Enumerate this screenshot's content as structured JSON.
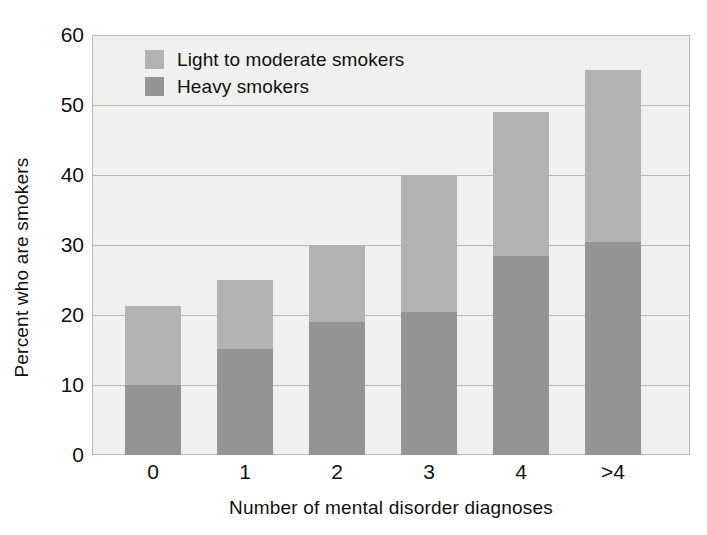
{
  "chart_data": {
    "type": "bar",
    "subtype": "stacked-vertical",
    "title": "",
    "xlabel": "Number of mental disorder diagnoses",
    "ylabel": "Percent who are smokers",
    "categories": [
      "0",
      "1",
      "2",
      "3",
      "4",
      ">4"
    ],
    "series": [
      {
        "name": "Heavy smokers",
        "color": "#949492",
        "values": [
          10.0,
          15.2,
          19.0,
          20.5,
          28.5,
          30.5
        ]
      },
      {
        "name": "Light to moderate smokers",
        "color": "#b3b3b1",
        "values": [
          11.3,
          9.8,
          11.0,
          19.5,
          20.5,
          24.5
        ]
      }
    ],
    "totals": [
      21.3,
      25.0,
      30.0,
      40.0,
      49.0,
      55.0
    ],
    "ylim": [
      0,
      60
    ],
    "yticks": [
      0,
      10,
      20,
      30,
      40,
      50,
      60
    ],
    "ytick_labels": [
      "0",
      "10",
      "20",
      "30",
      "40",
      "50",
      "60"
    ],
    "grid": "horizontal",
    "legend_position": "top-left-inside",
    "legend_entries": [
      {
        "label": "Light to moderate smokers",
        "color": "#b3b3b1"
      },
      {
        "label": "Heavy smokers",
        "color": "#949492"
      }
    ],
    "plot_background": "#f0f0ef",
    "axis_color": "#b9b9b7"
  }
}
